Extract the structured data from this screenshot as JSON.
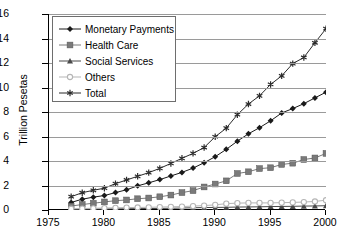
{
  "chart_data": {
    "type": "line",
    "title": "",
    "xlabel": "",
    "ylabel": "Trillion Pesetas",
    "xlim": [
      1975,
      2000
    ],
    "ylim": [
      0,
      16
    ],
    "ytick_step": 2,
    "xtick_step": 5,
    "grid": true,
    "legend_position": "top-left",
    "x": [
      1977,
      1978,
      1979,
      1980,
      1981,
      1982,
      1983,
      1984,
      1985,
      1986,
      1987,
      1988,
      1989,
      1990,
      1991,
      1992,
      1993,
      1994,
      1995,
      1996,
      1997,
      1998,
      1999,
      2000
    ],
    "xtick_labels": [
      "1975",
      "1980",
      "1985",
      "1990",
      "1995",
      "2000"
    ],
    "ytick_labels": [
      "0",
      "2",
      "4",
      "6",
      "8",
      "10",
      "12",
      "14",
      "16"
    ],
    "series": [
      {
        "name": "Monetary Payments",
        "marker": "diamond",
        "color": "#1a1a1a",
        "values": [
          0.62,
          0.88,
          1.05,
          1.18,
          1.42,
          1.65,
          1.97,
          2.22,
          2.48,
          2.78,
          3.07,
          3.42,
          3.86,
          4.35,
          4.95,
          5.62,
          6.22,
          6.72,
          7.28,
          7.92,
          8.28,
          8.68,
          9.15,
          9.62
        ]
      },
      {
        "name": "Health Care",
        "marker": "square",
        "color": "#7a7a7a",
        "values": [
          0.32,
          0.45,
          0.55,
          0.66,
          0.76,
          0.82,
          0.92,
          0.98,
          1.08,
          1.22,
          1.42,
          1.58,
          1.88,
          2.12,
          2.38,
          2.98,
          3.12,
          3.38,
          3.45,
          3.72,
          3.82,
          4.12,
          4.25,
          4.62
        ]
      },
      {
        "name": "Social Services",
        "marker": "triangle",
        "color": "#4a4a4a",
        "values": [
          0.05,
          0.06,
          0.07,
          0.08,
          0.09,
          0.1,
          0.11,
          0.12,
          0.13,
          0.14,
          0.16,
          0.18,
          0.2,
          0.21,
          0.22,
          0.24,
          0.25,
          0.26,
          0.28,
          0.29,
          0.3,
          0.32,
          0.33,
          0.35
        ]
      },
      {
        "name": "Others",
        "marker": "circle-open",
        "color": "#b5b5b5",
        "values": [
          0.1,
          0.12,
          0.14,
          0.16,
          0.18,
          0.2,
          0.21,
          0.22,
          0.24,
          0.26,
          0.28,
          0.32,
          0.36,
          0.42,
          0.52,
          0.56,
          0.58,
          0.58,
          0.58,
          0.6,
          0.62,
          0.65,
          0.7,
          0.8
        ]
      },
      {
        "name": "Total",
        "marker": "star",
        "color": "#2b2b2b",
        "values": [
          1.09,
          1.41,
          1.61,
          1.78,
          2.15,
          2.45,
          2.75,
          3.05,
          3.4,
          3.8,
          4.22,
          4.62,
          5.1,
          5.98,
          6.68,
          7.78,
          8.65,
          9.32,
          10.25,
          10.95,
          11.95,
          12.45,
          13.65,
          14.8
        ]
      }
    ]
  },
  "axes": {
    "y_title": "Trillion Pesetas"
  },
  "legend": {
    "items": [
      {
        "label": "Monetary Payments"
      },
      {
        "label": "Health Care"
      },
      {
        "label": "Social Services"
      },
      {
        "label": "Others"
      },
      {
        "label": "Total"
      }
    ]
  }
}
